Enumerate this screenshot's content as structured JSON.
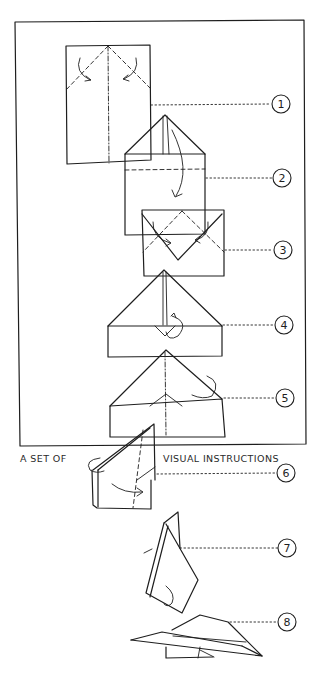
{
  "diagram": {
    "type": "paper-airplane-folding-instructions",
    "caption_left": "A SET OF",
    "caption_right": "VISUAL INSTRUCTIONS",
    "steps": [
      {
        "number": "1",
        "description": "Rectangle sheet with center crease; top corners folded down to center"
      },
      {
        "number": "2",
        "description": "Pointed top; fold tip down along dashed line"
      },
      {
        "number": "3",
        "description": "Fold corners in again toward center"
      },
      {
        "number": "4",
        "description": "Triangle nose with small flap folded up"
      },
      {
        "number": "5",
        "description": "Fold in half along center line"
      },
      {
        "number": "6",
        "description": "Folded in half; fold wing down"
      },
      {
        "number": "7",
        "description": "Fold other wing down"
      },
      {
        "number": "8",
        "description": "Finished paper airplane"
      }
    ],
    "colors": {
      "ink": "#1e1e1e",
      "paper": "#ffffff"
    }
  }
}
